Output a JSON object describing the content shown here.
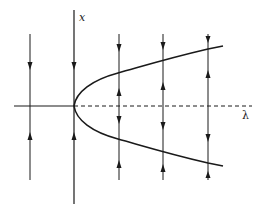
{
  "diagram": {
    "type": "pitchfork bifurcation diagram",
    "axes": {
      "vertical_label": "x",
      "horizontal_label": "λ"
    },
    "branches": [
      {
        "name": "stable-upper-branch",
        "style": "solid"
      },
      {
        "name": "stable-lower-branch",
        "style": "solid"
      },
      {
        "name": "unstable-zero-branch",
        "style": "dashed",
        "note": "x = 0 for λ > 0"
      },
      {
        "name": "stable-zero-branch",
        "style": "solid",
        "note": "x = 0 for λ < 0"
      }
    ],
    "flow_lines": [
      {
        "lambda_position": "negative",
        "arrows_toward": "x=0"
      },
      {
        "lambda_position": "positive-1",
        "arrows_toward": "upper and lower branches, away from x=0"
      },
      {
        "lambda_position": "positive-2",
        "arrows_toward": "upper and lower branches, away from x=0"
      },
      {
        "lambda_position": "positive-3",
        "arrows_toward": "upper and lower branches, away from x=0"
      }
    ],
    "colors": {
      "ink": "#1a1a1a",
      "background": "#ffffff"
    }
  }
}
